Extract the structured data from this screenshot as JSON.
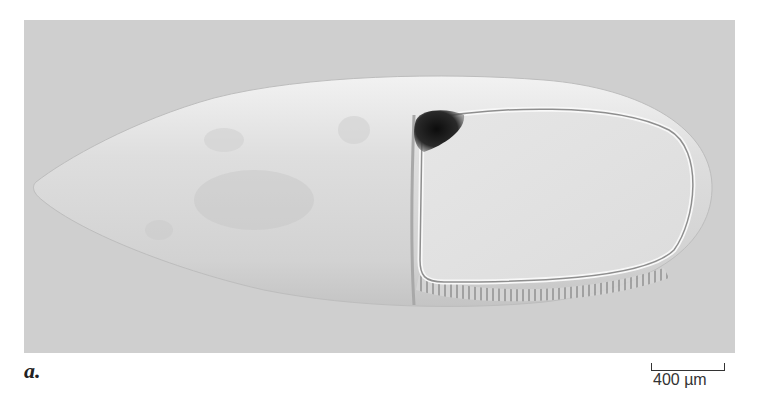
{
  "figure": {
    "panel_label": "a.",
    "scale_bar": {
      "label": "400 µm",
      "length_px": 74
    },
    "image": {
      "subject": "elongated egg / embryo under DIC microscopy",
      "background_color": "#cfcfcf",
      "egg_color": "#e4e4e4",
      "dark_spot_color": "#1a1a1a"
    }
  }
}
